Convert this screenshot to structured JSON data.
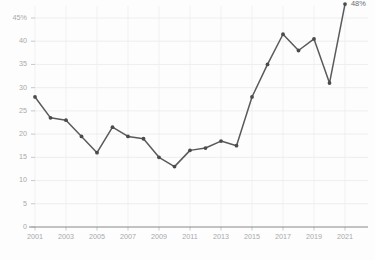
{
  "chart_data": {
    "type": "line",
    "title": "",
    "subtitle": "",
    "xlabel": "",
    "ylabel": "",
    "x": [
      2001,
      2002,
      2003,
      2004,
      2005,
      2006,
      2007,
      2008,
      2009,
      2010,
      2011,
      2012,
      2013,
      2014,
      2015,
      2016,
      2017,
      2018,
      2019,
      2020,
      2021
    ],
    "values": [
      28,
      23.5,
      23,
      19.5,
      16,
      21.5,
      19.5,
      19,
      15,
      13,
      16.5,
      17,
      18.5,
      17.5,
      28,
      35,
      41.5,
      38,
      40.5,
      31,
      48
    ],
    "series": [
      {
        "name": "",
        "values": [
          28,
          23.5,
          23,
          19.5,
          16,
          21.5,
          19.5,
          19,
          15,
          13,
          16.5,
          17,
          18.5,
          17.5,
          28,
          35,
          41.5,
          38,
          40.5,
          31,
          48
        ]
      }
    ],
    "xlim": [
      2001,
      2021
    ],
    "ylim": [
      0,
      48
    ],
    "y_ticks": [
      0,
      5,
      10,
      15,
      20,
      25,
      30,
      35,
      40,
      45
    ],
    "y_tick_labels": [
      "0",
      "5",
      "10",
      "15",
      "20",
      "25",
      "30",
      "35",
      "40",
      "45%"
    ],
    "x_ticks": [
      2001,
      2003,
      2005,
      2007,
      2009,
      2011,
      2013,
      2015,
      2017,
      2019,
      2021
    ],
    "x_tick_labels": [
      "2001",
      "2003",
      "2005",
      "2007",
      "2009",
      "2011",
      "2013",
      "2015",
      "2017",
      "2019",
      "2021"
    ],
    "grid": true,
    "legend": "none",
    "annotations": [
      {
        "text": "48%",
        "x": 2021,
        "y": 48
      }
    ],
    "colors": {
      "line": "#595a5c",
      "point": "#4a4b4d",
      "grid": "#e9eaec",
      "axis": "#8a8a8a",
      "tick_label": "#a7a9ab",
      "annotation": "#6b6c6e",
      "background": "#fdfdfd"
    }
  }
}
